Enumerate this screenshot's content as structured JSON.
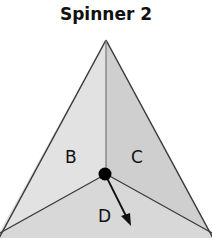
{
  "title": "Spinner 2",
  "spinner": {
    "shape": "triangle",
    "sections": [
      {
        "label": "B",
        "color": "#e2e2e2"
      },
      {
        "label": "C",
        "color": "#cfcfcf"
      },
      {
        "label": "D",
        "color": "#d8d8d8"
      }
    ],
    "outline_color": "#3a3a3a",
    "center_dot_color": "#000000",
    "arrow_pointing_to": "D"
  }
}
